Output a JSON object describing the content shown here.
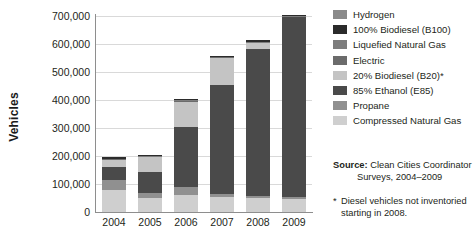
{
  "axis": {
    "y_title": "Vehicles",
    "y_ticks": [
      "700,000",
      "600,000",
      "500,000",
      "400,000",
      "300,000",
      "200,000",
      "100,000",
      "0"
    ],
    "x_ticks": [
      "2004",
      "2005",
      "2006",
      "2007",
      "2008",
      "2009"
    ]
  },
  "legend": {
    "items": [
      {
        "label": "Hydrogen",
        "color": "#8a8a8a"
      },
      {
        "label": "100% Biodiesel (B100)",
        "color": "#2b2b2b"
      },
      {
        "label": "Liquefied Natural Gas",
        "color": "#7d7d7d"
      },
      {
        "label": "Electric",
        "color": "#6b6b6b"
      },
      {
        "label": "20% Biodiesel (B20)*",
        "color": "#c4c4c4"
      },
      {
        "label": "85% Ethanol (E85)",
        "color": "#4a4a4a"
      },
      {
        "label": "Propane",
        "color": "#909090"
      },
      {
        "label": "Compressed Natural Gas",
        "color": "#cfcfcf"
      }
    ]
  },
  "source": {
    "label": "Source:",
    "line1": "Clean Cities Coordinator",
    "line2": "Surveys, 2004–2009"
  },
  "footnote": {
    "marker": "*",
    "text": "Diesel vehicles not inventoried starting in 2008."
  },
  "chart_data": {
    "type": "bar",
    "title": "",
    "subtitle": "",
    "xlabel": "",
    "ylabel": "Vehicles",
    "ylim": [
      0,
      700000
    ],
    "ytick_step": 100000,
    "grid": true,
    "stacked": true,
    "legend_position": "right",
    "categories": [
      "2004",
      "2005",
      "2006",
      "2007",
      "2008",
      "2009"
    ],
    "series": [
      {
        "name": "Compressed Natural Gas",
        "color": "#cfcfcf",
        "values": [
          78000,
          49000,
          60000,
          55000,
          50000,
          48000
        ]
      },
      {
        "name": "Propane",
        "color": "#909090",
        "values": [
          35000,
          19000,
          30000,
          8000,
          8000,
          7000
        ]
      },
      {
        "name": "85% Ethanol (E85)",
        "color": "#4a4a4a",
        "values": [
          48000,
          76000,
          215000,
          392000,
          525000,
          641000
        ]
      },
      {
        "name": "20% Biodiesel (B20)*",
        "color": "#c4c4c4",
        "values": [
          25000,
          52000,
          88000,
          95000,
          20000,
          0
        ]
      },
      {
        "name": "Electric",
        "color": "#6b6b6b",
        "values": [
          2000,
          2000,
          2000,
          2000,
          2000,
          2000
        ]
      },
      {
        "name": "Liquefied Natural Gas",
        "color": "#7d7d7d",
        "values": [
          3000,
          3000,
          4000,
          2000,
          2000,
          2000
        ]
      },
      {
        "name": "100% Biodiesel (B100)",
        "color": "#2b2b2b",
        "values": [
          4000,
          4000,
          6000,
          4000,
          6000,
          3000
        ]
      },
      {
        "name": "Hydrogen",
        "color": "#8a8a8a",
        "values": [
          0,
          0,
          0,
          0,
          0,
          0
        ]
      }
    ],
    "totals": [
      195000,
      205000,
      405000,
      558000,
      613000,
      703000
    ]
  }
}
